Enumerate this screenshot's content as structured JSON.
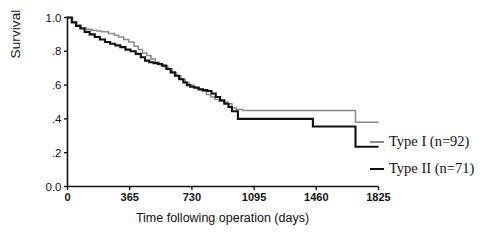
{
  "chart_data": {
    "type": "line",
    "title": "",
    "xlabel": "Time following operation (days)",
    "ylabel": "Survival",
    "xlim": [
      0,
      1825
    ],
    "ylim": [
      0.0,
      1.0
    ],
    "grid": false,
    "legend_position": "right-outside",
    "xticks": [
      0,
      365,
      730,
      1095,
      1460,
      1825
    ],
    "xtick_labels": [
      "0",
      "365",
      "730",
      "1095",
      "1460",
      "1825"
    ],
    "yticks": [
      0.0,
      0.2,
      0.4,
      0.6,
      0.8,
      1.0
    ],
    "ytick_labels": [
      "0.0",
      ".2",
      ".4",
      ".6",
      ".8",
      "1.0"
    ],
    "series": [
      {
        "name": "Type I (n=92)",
        "n": 92,
        "color": "#8a8a8a",
        "step": "post",
        "x": [
          0,
          30,
          55,
          80,
          110,
          140,
          170,
          200,
          240,
          275,
          300,
          330,
          360,
          390,
          415,
          440,
          465,
          490,
          515,
          540,
          565,
          590,
          615,
          640,
          665,
          690,
          715,
          740,
          765,
          790,
          815,
          840,
          865,
          890,
          915,
          940,
          965,
          990,
          1030,
          1690,
          1825
        ],
        "y": [
          1.0,
          0.975,
          0.955,
          0.94,
          0.93,
          0.925,
          0.92,
          0.915,
          0.905,
          0.895,
          0.885,
          0.87,
          0.855,
          0.83,
          0.81,
          0.79,
          0.775,
          0.755,
          0.735,
          0.72,
          0.71,
          0.695,
          0.675,
          0.655,
          0.635,
          0.615,
          0.6,
          0.585,
          0.575,
          0.565,
          0.545,
          0.53,
          0.515,
          0.505,
          0.5,
          0.49,
          0.465,
          0.455,
          0.45,
          0.38,
          0.38
        ]
      },
      {
        "name": "Type II (n=71)",
        "n": 71,
        "color": "#111111",
        "step": "post",
        "x": [
          0,
          25,
          50,
          75,
          100,
          130,
          160,
          190,
          220,
          250,
          280,
          310,
          340,
          370,
          400,
          430,
          455,
          480,
          505,
          530,
          555,
          580,
          605,
          630,
          655,
          680,
          700,
          720,
          745,
          770,
          795,
          820,
          845,
          870,
          895,
          920,
          945,
          965,
          1000,
          1440,
          1690,
          1825
        ],
        "y": [
          1.0,
          0.97,
          0.95,
          0.935,
          0.915,
          0.9,
          0.885,
          0.87,
          0.855,
          0.845,
          0.835,
          0.825,
          0.81,
          0.8,
          0.785,
          0.765,
          0.745,
          0.735,
          0.73,
          0.725,
          0.715,
          0.695,
          0.675,
          0.655,
          0.635,
          0.615,
          0.6,
          0.59,
          0.585,
          0.575,
          0.57,
          0.565,
          0.55,
          0.53,
          0.51,
          0.49,
          0.47,
          0.445,
          0.4,
          0.355,
          0.235,
          0.235
        ]
      }
    ]
  },
  "legend": {
    "items": [
      {
        "label": "Type I (n=92)",
        "color": "#8a8a8a"
      },
      {
        "label": "Type II (n=71)",
        "color": "#111111"
      }
    ]
  }
}
